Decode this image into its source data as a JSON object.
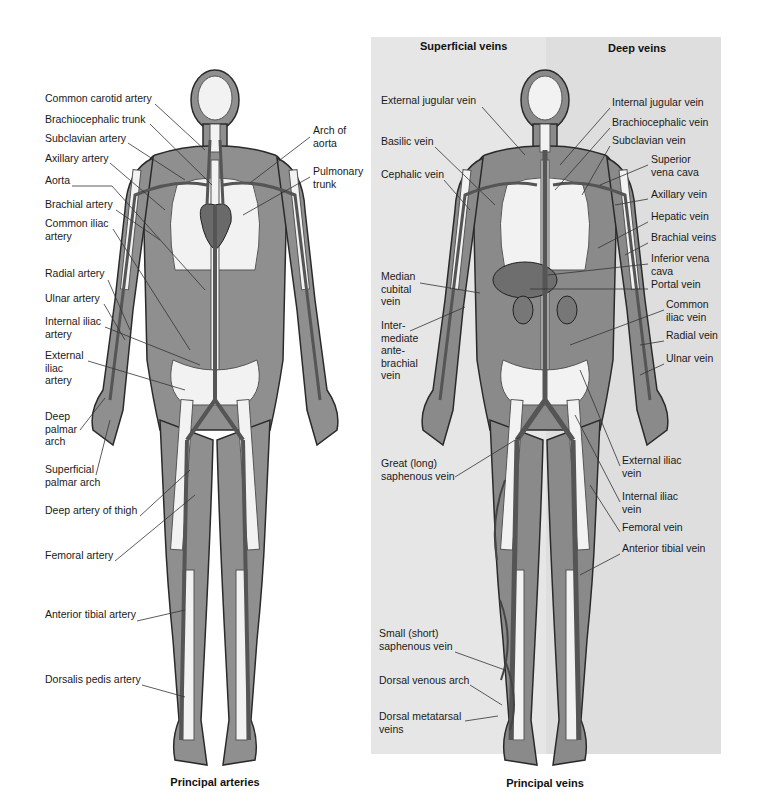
{
  "left_panel": {
    "caption": "Principal arteries",
    "labels": [
      {
        "text": "Common carotid artery",
        "x": 45,
        "y": 98
      },
      {
        "text": "Brachiocephalic trunk",
        "x": 45,
        "y": 119
      },
      {
        "text": "Subclavian artery",
        "x": 45,
        "y": 138
      },
      {
        "text": "Axillary artery",
        "x": 45,
        "y": 158
      },
      {
        "text": "Aorta",
        "x": 45,
        "y": 180
      },
      {
        "text": "Brachial artery",
        "x": 45,
        "y": 204
      },
      {
        "text": "Common iliac\nartery",
        "x": 45,
        "y": 223
      },
      {
        "text": "Radial artery",
        "x": 45,
        "y": 273
      },
      {
        "text": "Ulnar artery",
        "x": 45,
        "y": 298
      },
      {
        "text": "Internal iliac\nartery",
        "x": 45,
        "y": 321
      },
      {
        "text": "External\niliac\nartery",
        "x": 45,
        "y": 355
      },
      {
        "text": "Deep\npalmar\narch",
        "x": 45,
        "y": 416
      },
      {
        "text": "Superficial\npalmar arch",
        "x": 45,
        "y": 469
      },
      {
        "text": "Deep artery of thigh",
        "x": 45,
        "y": 510
      },
      {
        "text": "Femoral artery",
        "x": 45,
        "y": 555
      },
      {
        "text": "Anterior tibial artery",
        "x": 45,
        "y": 614
      },
      {
        "text": "Dorsalis pedis artery",
        "x": 45,
        "y": 679
      },
      {
        "text": "Arch of\naorta",
        "x": 313,
        "y": 130
      },
      {
        "text": "Pulmonary\ntrunk",
        "x": 313,
        "y": 171
      }
    ]
  },
  "right_panel": {
    "caption": "Principal veins",
    "headers": {
      "superficial": "Superficial veins",
      "deep": "Deep veins"
    },
    "labels": [
      {
        "text": "External jugular vein",
        "x": 381,
        "y": 100
      },
      {
        "text": "Basilic vein",
        "x": 381,
        "y": 141
      },
      {
        "text": "Cephalic vein",
        "x": 381,
        "y": 174
      },
      {
        "text": "Median\ncubital\nvein",
        "x": 381,
        "y": 276
      },
      {
        "text": "Inter-\nmediate\nante-\nbrachial\nvein",
        "x": 381,
        "y": 325
      },
      {
        "text": "Great (long)\nsaphenous vein",
        "x": 381,
        "y": 463
      },
      {
        "text": "Small (short)\nsaphenous vein",
        "x": 379,
        "y": 633
      },
      {
        "text": "Dorsal venous arch",
        "x": 379,
        "y": 680
      },
      {
        "text": "Dorsal metatarsal\nveins",
        "x": 379,
        "y": 716
      },
      {
        "text": "Internal jugular vein",
        "x": 612,
        "y": 102
      },
      {
        "text": "Brachiocephalic vein",
        "x": 612,
        "y": 122
      },
      {
        "text": "Subclavian vein",
        "x": 612,
        "y": 140
      },
      {
        "text": "Superior\nvena cava",
        "x": 651,
        "y": 159
      },
      {
        "text": "Axillary vein",
        "x": 651,
        "y": 194
      },
      {
        "text": "Hepatic vein",
        "x": 651,
        "y": 216
      },
      {
        "text": "Brachial veins",
        "x": 651,
        "y": 237
      },
      {
        "text": "Inferior vena\ncava",
        "x": 651,
        "y": 258
      },
      {
        "text": "Portal vein",
        "x": 651,
        "y": 284
      },
      {
        "text": "Common\niliac vein",
        "x": 666,
        "y": 304
      },
      {
        "text": "Radial vein",
        "x": 666,
        "y": 335
      },
      {
        "text": "Ulnar vein",
        "x": 666,
        "y": 358
      },
      {
        "text": "External iliac\nvein",
        "x": 622,
        "y": 460
      },
      {
        "text": "Internal iliac\nvein",
        "x": 622,
        "y": 496
      },
      {
        "text": "Femoral vein",
        "x": 622,
        "y": 527
      },
      {
        "text": "Anterior tibial vein",
        "x": 622,
        "y": 548
      }
    ]
  },
  "colors": {
    "body_fill": "#8f8f8f",
    "bone": "#f2f2f2",
    "vessel": "#5a5a5a",
    "panel_bg": "#e6e6e6",
    "outline": "#2a2a2a"
  }
}
